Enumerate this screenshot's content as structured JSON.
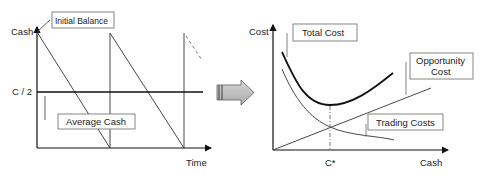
{
  "left_panel": {
    "y_axis_label": "Cash",
    "x_axis_label": "Time",
    "c_half_label": "C / 2",
    "callouts": {
      "initial_balance": "Initial Balance",
      "average_cash": "Average Cash"
    }
  },
  "right_panel": {
    "y_axis_label": "Cost",
    "x_axis_label": "Cash",
    "optimum_label": "C*",
    "callouts": {
      "total_cost": "Total Cost",
      "opportunity_cost_line1": "Opportunity",
      "opportunity_cost_line2": "Cost",
      "trading_costs": "Trading Costs"
    }
  },
  "colors": {
    "axis": "#111111",
    "thin_line": "#333333",
    "total_cost": "#111111",
    "arrow_fill": "#bdbdbd",
    "arrow_stroke": "#6e6e6e",
    "box_stroke": "#666666"
  }
}
